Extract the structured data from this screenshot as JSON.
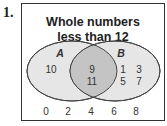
{
  "problem_number": "1.",
  "title_line1": "Whole numbers",
  "title_line2": "less than 12",
  "sets": {
    "A": {
      "label": "A",
      "only": [
        "10"
      ]
    },
    "B": {
      "label": "B",
      "only": [
        "1",
        "3",
        "5",
        "7"
      ]
    },
    "intersection": [
      "9",
      "11"
    ]
  },
  "outside": [
    "0",
    "2",
    "4",
    "6",
    "8"
  ],
  "colors": {
    "circle_fill": "#e6e6e6",
    "intersection_fill": "#c4c4c4",
    "stroke": "#444444"
  }
}
